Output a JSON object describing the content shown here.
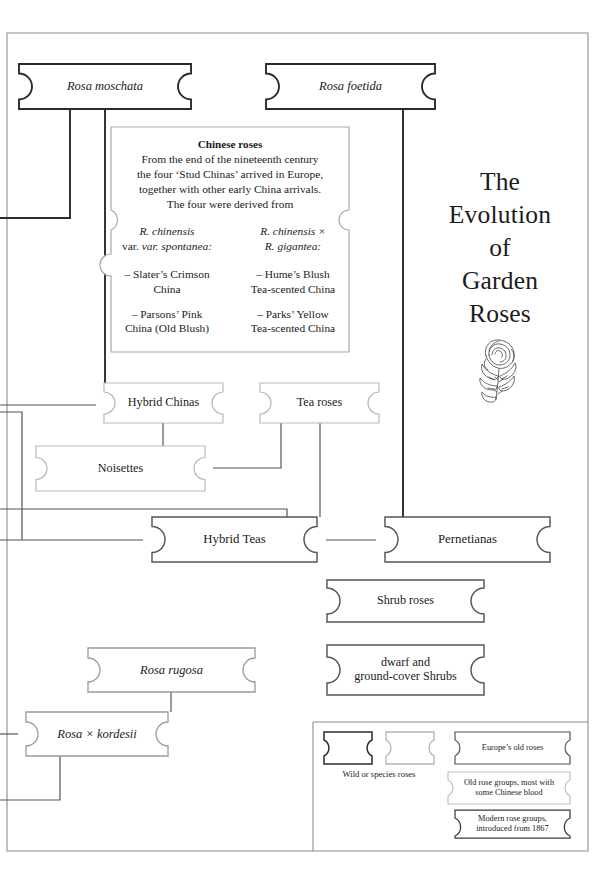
{
  "title": {
    "lines": [
      "The",
      "Evolution",
      "of",
      "Garden",
      "Roses"
    ],
    "emblem": "rose-illustration"
  },
  "chinese_box": {
    "heading": "Chinese roses",
    "body_lines": [
      "From the end of the nineteenth century",
      "the four ‘Stud Chinas’ arrived in Europe,",
      "together with other early China arrivals.",
      "The four were derived from"
    ],
    "left_parent": [
      "R. chinensis",
      "var. spontanea:"
    ],
    "right_parent": [
      "R. chinensis ×",
      "R. gigantea:"
    ],
    "left_items": [
      [
        "– Slater’s Crimson",
        "China"
      ],
      [
        "– Parsons’ Pink",
        "China (Old Blush)"
      ]
    ],
    "right_items": [
      [
        "– Hume’s Blush",
        "Tea-scented China"
      ],
      [
        "– Parks’ Yellow",
        "Tea-scented China"
      ]
    ]
  },
  "nodes": [
    {
      "id": "rosa-moschata",
      "label": "Rosa moschata",
      "italic": true,
      "style": "wild",
      "x": 10,
      "y": 64,
      "w": 190,
      "h": 45,
      "font": 12.5
    },
    {
      "id": "rosa-foetida",
      "label": "Rosa foetida",
      "italic": true,
      "style": "wild",
      "x": 257,
      "y": 64,
      "w": 187,
      "h": 45,
      "font": 12.5
    },
    {
      "id": "hybrid-chinas",
      "label": "Hybrid Chinas",
      "italic": false,
      "style": "old",
      "x": 96,
      "y": 383,
      "w": 135,
      "h": 40,
      "font": 12.2
    },
    {
      "id": "tea-roses",
      "label": "Tea roses",
      "italic": false,
      "style": "old",
      "x": 252,
      "y": 383,
      "w": 135,
      "h": 40,
      "font": 12.2
    },
    {
      "id": "noisettes",
      "label": "Noisettes",
      "italic": false,
      "style": "old",
      "x": 28,
      "y": 446,
      "w": 185,
      "h": 45,
      "font": 12.2
    },
    {
      "id": "hybrid-teas",
      "label": "Hybrid Teas",
      "italic": false,
      "style": "modern",
      "x": 143,
      "y": 517,
      "w": 183,
      "h": 45,
      "font": 12.8
    },
    {
      "id": "pernetianas",
      "label": "Pernetianas",
      "italic": false,
      "style": "modern",
      "x": 376,
      "y": 517,
      "w": 183,
      "h": 45,
      "font": 12.8
    },
    {
      "id": "shrub-roses",
      "label": "Shrub roses",
      "italic": false,
      "style": "modern",
      "x": 318,
      "y": 580,
      "w": 175,
      "h": 42,
      "font": 12.2
    },
    {
      "id": "dwarf-ground-cover",
      "label": "dwarf and\nground-cover Shrubs",
      "italic": false,
      "style": "modern",
      "x": 318,
      "y": 645,
      "w": 175,
      "h": 50,
      "font": 12.2
    },
    {
      "id": "rosa-rugosa",
      "label": "Rosa rugosa",
      "italic": true,
      "style": "wild-light",
      "x": 80,
      "y": 648,
      "w": 183,
      "h": 44,
      "font": 12.5
    },
    {
      "id": "rosa-kordesii",
      "label": "Rosa × kordesii",
      "italic": true,
      "style": "wild-light",
      "x": 18,
      "y": 712,
      "w": 158,
      "h": 44,
      "font": 12.5
    }
  ],
  "legend": {
    "wild_label": "Wild or species roses",
    "entries": [
      {
        "id": "europes-old-roses",
        "text": "Europe’s old roses",
        "style": "old-dark"
      },
      {
        "id": "old-rose-groups",
        "text": "Old rose groups, most with\nsome Chinese blood",
        "style": "old-light"
      },
      {
        "id": "modern-rose-groups",
        "text": "Modern rose groups,\nintroduced from 1867",
        "style": "modern"
      }
    ]
  },
  "colors": {
    "dark_stroke": "#2b2b2b",
    "mid_stroke": "#6e6e73",
    "light_stroke": "#b4b4b8",
    "frame": "#8d8d90",
    "text": "#1a1a1a"
  }
}
